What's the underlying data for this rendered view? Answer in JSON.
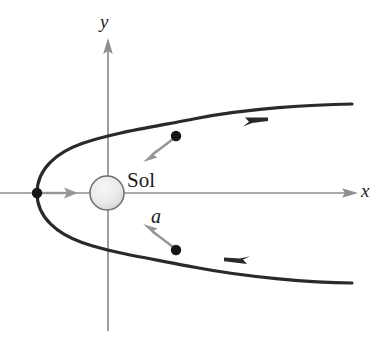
{
  "figure": {
    "background_color": "#ffffff",
    "axes": {
      "x_axis": {
        "label": "x",
        "color": "#8a8a8a",
        "start": [
          0,
          193
        ],
        "end": [
          356,
          193
        ],
        "arrow_at": "end"
      },
      "y_axis": {
        "label": "y",
        "color": "#8a8a8a",
        "start": [
          108,
          330
        ],
        "end": [
          108,
          40
        ],
        "arrow_at": "end"
      },
      "origin": [
        108,
        193
      ]
    },
    "body": {
      "name": "Sol",
      "label": "Sol",
      "center": [
        107,
        193
      ],
      "radius": 17,
      "fill_color": "#e8e8e8",
      "stroke_color": "#6e6e6e"
    },
    "trajectory": {
      "type": "parabola",
      "opens": "right",
      "vertex": [
        37,
        193
      ],
      "color": "#262626",
      "stroke_width": 3.2,
      "upper_end": [
        352,
        104
      ],
      "lower_end": [
        352,
        283
      ],
      "direction_arrows": [
        {
          "at": [
            258,
            120
          ],
          "points": "right"
        },
        {
          "at": [
            234,
            262
          ],
          "points": "left"
        }
      ]
    },
    "markers": [
      {
        "name": "vertex-marker",
        "at": [
          37,
          193
        ],
        "radius": 5,
        "color": "#1a1a1a"
      },
      {
        "name": "upper-body-marker",
        "at": [
          176,
          136
        ],
        "radius": 5,
        "color": "#1a1a1a"
      },
      {
        "name": "lower-body-marker",
        "at": [
          176,
          250
        ],
        "radius": 5,
        "color": "#1a1a1a"
      }
    ],
    "acceleration_vectors": {
      "label": "a",
      "color": "#8f8f8f",
      "vectors": [
        {
          "name": "accel-vector-vertex",
          "from": [
            40,
            193
          ],
          "to": [
            76,
            193
          ]
        },
        {
          "name": "accel-vector-upper",
          "from": [
            175,
            137
          ],
          "to": [
            144,
            161
          ]
        },
        {
          "name": "accel-vector-lower",
          "from": [
            175,
            249
          ],
          "to": [
            144,
            221
          ]
        }
      ]
    }
  },
  "labels": {
    "x": "x",
    "y": "y",
    "sol": "Sol",
    "a": "a"
  }
}
